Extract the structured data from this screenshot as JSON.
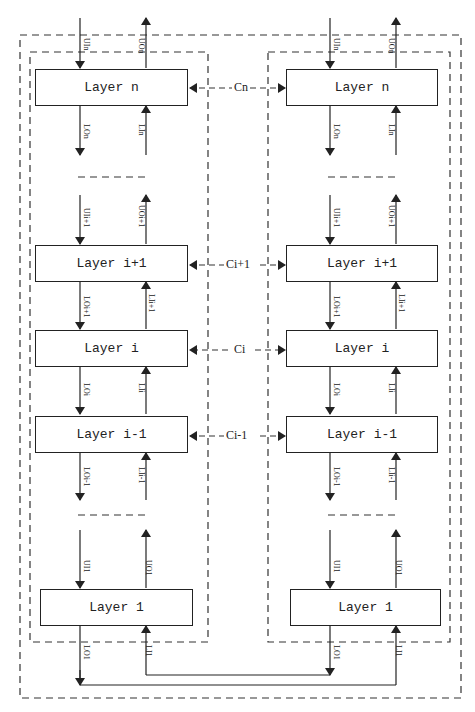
{
  "stacks": [
    {
      "name": "left-stack",
      "layers": [
        "Layer n",
        "Layer i+1",
        "Layer i",
        "Layer i-1",
        "Layer 1"
      ]
    },
    {
      "name": "right-stack",
      "layers": [
        "Layer n",
        "Layer i+1",
        "Layer i",
        "Layer i-1",
        "Layer 1"
      ]
    }
  ],
  "couplings": [
    "Cn",
    "Ci+1",
    "Ci",
    "Ci-1"
  ],
  "signals": {
    "n": {
      "ui": "UIn",
      "uo": "UOn",
      "lo": "LOn",
      "li": "LIn"
    },
    "i+1": {
      "ui": "UIi+1",
      "uo": "UOi+1",
      "lo": "LOi+1",
      "li": "LIi+1"
    },
    "i": {
      "lo": "LOi",
      "li": "LIi"
    },
    "i-1": {
      "lo": "LOi-1",
      "li": "LIi-1"
    },
    "1": {
      "ui": "UI1",
      "uo": "UO1",
      "lo": "LO1",
      "li": "LI1"
    }
  }
}
